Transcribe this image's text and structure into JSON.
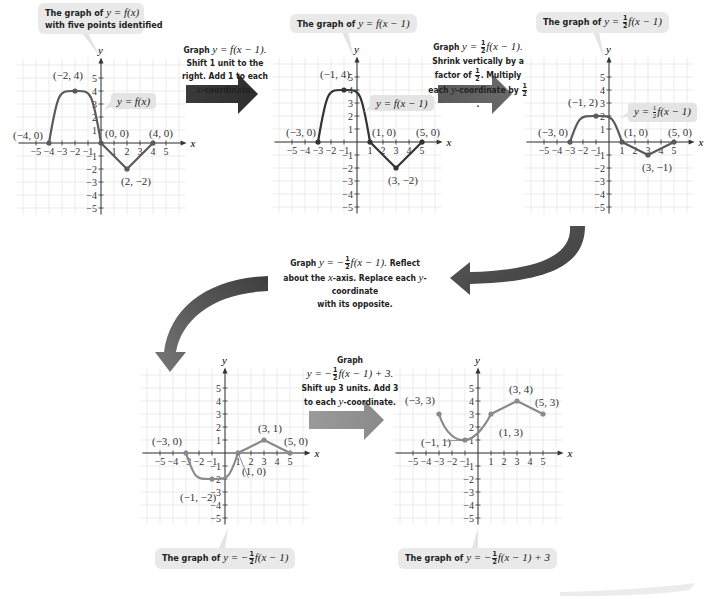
{
  "figure": {
    "grid_range": {
      "xmin": -5,
      "xmax": 5,
      "ymin": -5,
      "ymax": 5
    },
    "axis_labels": {
      "x": "x",
      "y": "y"
    },
    "colors": {
      "curve_original": "#5a5a5a",
      "curve_step2": "#333333",
      "curve_transformed": "#8a8a8a",
      "grid": "#e6e6e6",
      "callout_bg": "#e9e9e9",
      "arrow_dark": "#3a3a3a",
      "arrow_mid": "#5e5e5e",
      "arrow_light": "#8c8c8c"
    }
  },
  "graphs": [
    {
      "id": "g1",
      "callout": {
        "line1_prefix": "The graph of ",
        "line1_math": "y = f(x)",
        "line2": "with five points identified"
      },
      "curve_label": "y = f(x)",
      "points": [
        {
          "x": -4,
          "y": 0,
          "label": "(−4, 0)"
        },
        {
          "x": -2,
          "y": 4,
          "label": "(−2, 4)"
        },
        {
          "x": 0,
          "y": 0,
          "label": "(0, 0)"
        },
        {
          "x": 2,
          "y": -2,
          "label": "(2, −2)"
        },
        {
          "x": 4,
          "y": 0,
          "label": "(4, 0)"
        }
      ]
    },
    {
      "id": "g2",
      "callout": {
        "prefix": "The graph of ",
        "math": "y = f(x − 1)"
      },
      "curve_label": "y = f(x − 1)",
      "points": [
        {
          "x": -3,
          "y": 0,
          "label": "(−3, 0)"
        },
        {
          "x": -1,
          "y": 4,
          "label": "(−1, 4)"
        },
        {
          "x": 1,
          "y": 0,
          "label": "(1, 0)"
        },
        {
          "x": 3,
          "y": -2,
          "label": "(3, −2)"
        },
        {
          "x": 5,
          "y": 0,
          "label": "(5, 0)"
        }
      ]
    },
    {
      "id": "g3",
      "callout": {
        "prefix": "The graph of ",
        "math_pre": "y = ",
        "frac": [
          "1",
          "2"
        ],
        "math_post": "f(x − 1)"
      },
      "curve_label": {
        "pre": "y = ",
        "frac": [
          "1",
          "2"
        ],
        "post": "f(x − 1)"
      },
      "points": [
        {
          "x": -3,
          "y": 0,
          "label": "(−3, 0)"
        },
        {
          "x": -1,
          "y": 2,
          "label": "(−1, 2)"
        },
        {
          "x": 1,
          "y": 0,
          "label": "(1, 0)"
        },
        {
          "x": 3,
          "y": -1,
          "label": "(3, −1)"
        },
        {
          "x": 5,
          "y": 0,
          "label": "(5, 0)"
        }
      ]
    },
    {
      "id": "g4",
      "callout": {
        "prefix": "The graph of ",
        "math_pre": "y = −",
        "frac": [
          "1",
          "2"
        ],
        "math_post": "f(x − 1)"
      },
      "points": [
        {
          "x": -3,
          "y": 0,
          "label": "(−3, 0)"
        },
        {
          "x": -1,
          "y": -2,
          "label": "(−1, −2)"
        },
        {
          "x": 1,
          "y": 0,
          "label": "(1, 0)"
        },
        {
          "x": 3,
          "y": 1,
          "label": "(3, 1)"
        },
        {
          "x": 5,
          "y": 0,
          "label": "(5, 0)"
        }
      ]
    },
    {
      "id": "g5",
      "callout": {
        "prefix": "The graph of ",
        "math_pre": "y = −",
        "frac": [
          "1",
          "2"
        ],
        "math_post": "f(x − 1) + 3"
      },
      "points": [
        {
          "x": -3,
          "y": 3,
          "label": "(−3, 3)"
        },
        {
          "x": -1,
          "y": 1,
          "label": "(−1, 1)"
        },
        {
          "x": 1,
          "y": 3,
          "label": "(1, 3)"
        },
        {
          "x": 3,
          "y": 4,
          "label": "(3, 4)"
        },
        {
          "x": 5,
          "y": 3,
          "label": "(5, 3)"
        }
      ]
    }
  ],
  "steps": [
    {
      "id": "step1",
      "lines": [
        "Graph ",
        "y = f(x − 1).",
        "Shift 1 unit to the",
        "right. Add 1 to each",
        "x",
        "-coordinate."
      ]
    },
    {
      "id": "step2",
      "graph_word": "Graph ",
      "eq_pre": "y = ",
      "frac": [
        "1",
        "2"
      ],
      "eq_post": "f(x − 1).",
      "line2": "Shrink vertically by a",
      "line3_pre": "factor of ",
      "line3_post": ". Multiply",
      "line4_pre": "each ",
      "line4_var": "y",
      "line4_post": "-coordinate by "
    },
    {
      "id": "step3",
      "graph_word": "Graph ",
      "eq_pre": "y = −",
      "frac": [
        "1",
        "2"
      ],
      "eq_post": "f(x − 1).",
      "line1_tail": " Reflect",
      "line2_pre": "about the ",
      "line2_var": "x",
      "line2_mid": "-axis. Replace each ",
      "line2_var2": "y",
      "line2_post": "-coordinate",
      "line3": "with its opposite."
    },
    {
      "id": "step4",
      "line1": "Graph",
      "eq_pre": "y = −",
      "frac": [
        "1",
        "2"
      ],
      "eq_post": "f(x − 1) + 3.",
      "line3": "Shift up 3 units. Add 3",
      "line4_pre": "to each ",
      "line4_var": "y",
      "line4_post": "-coordinate."
    }
  ],
  "tick_labels": {
    "x": [
      "−5",
      "−4",
      "−3",
      "−2",
      "−1",
      "1",
      "2",
      "3",
      "4",
      "5"
    ],
    "y": [
      "5",
      "4",
      "3",
      "2",
      "1",
      "−1",
      "−2",
      "−3",
      "−4",
      "−5"
    ]
  }
}
